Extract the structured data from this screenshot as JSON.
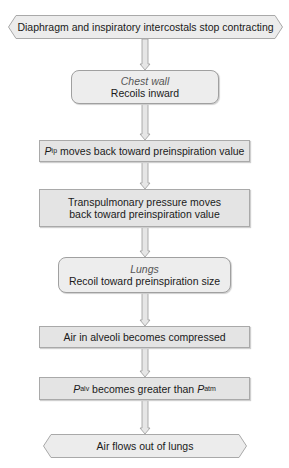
{
  "diagram": {
    "colors": {
      "box_fill": "#e4e4e4",
      "rounded_fill": "#ededed",
      "hex_fill": "#ececec",
      "border": "#a9a9a9",
      "arrow_fill": "#e6e6e6",
      "arrow_stroke": "#9a9a9a"
    },
    "nodes": [
      {
        "id": "start",
        "shape": "hexagon",
        "text": "Diaphragm and inspiratory intercostals stop contracting"
      },
      {
        "id": "chest-wall",
        "shape": "rounded",
        "label": "Chest wall",
        "text": "Recoils inward"
      },
      {
        "id": "pip",
        "shape": "rect",
        "var": "P",
        "sub": "ip",
        "text": " moves back toward preinspiration value"
      },
      {
        "id": "transpulmonary",
        "shape": "rect",
        "line1": "Transpulmonary pressure moves",
        "line2": "back toward preinspiration value"
      },
      {
        "id": "lungs",
        "shape": "rounded",
        "label": "Lungs",
        "text": "Recoil toward preinspiration size"
      },
      {
        "id": "alveoli",
        "shape": "rect",
        "text": "Air in alveoli becomes compressed"
      },
      {
        "id": "palv",
        "shape": "rect",
        "var1": "P",
        "sub1": "alv",
        "middle": " becomes greater than ",
        "var2": "P",
        "sub2": "atm"
      },
      {
        "id": "end",
        "shape": "hexagon",
        "text": "Air flows out of lungs"
      }
    ],
    "edges": [
      [
        "start",
        "chest-wall"
      ],
      [
        "chest-wall",
        "pip"
      ],
      [
        "pip",
        "transpulmonary"
      ],
      [
        "transpulmonary",
        "lungs"
      ],
      [
        "lungs",
        "alveoli"
      ],
      [
        "alveoli",
        "palv"
      ],
      [
        "palv",
        "end"
      ]
    ]
  }
}
